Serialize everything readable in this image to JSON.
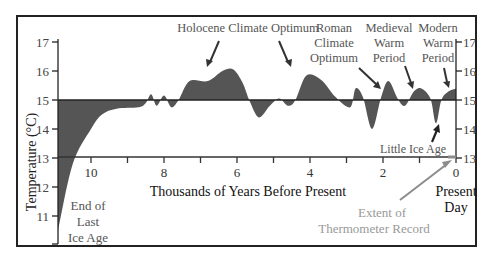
{
  "chart_data": {
    "type": "area",
    "title": "",
    "xlabel": "Thousands of Years Before Present",
    "ylabel": "Temperature (°C)",
    "xlim": [
      11,
      0
    ],
    "ylim": [
      10,
      17
    ],
    "baseline": 15,
    "x_ticks": [
      10,
      9,
      8,
      7,
      6,
      5,
      4,
      3,
      2,
      1,
      0
    ],
    "x_tick_labels": [
      "10",
      "8",
      "6",
      "4",
      "2",
      "0"
    ],
    "x_tick_label_values": [
      10,
      8,
      6,
      4,
      2,
      0
    ],
    "y_ticks": [
      17,
      16,
      15,
      14,
      13,
      12,
      11
    ],
    "y_ticks_right": [
      17,
      16,
      15,
      14,
      13
    ],
    "grid": false,
    "legend": null,
    "series": [
      {
        "name": "Global Temperature",
        "x": [
          11.0,
          10.5,
          10.0,
          9.7,
          9.3,
          8.7,
          8.5,
          8.35,
          8.2,
          8.0,
          7.8,
          7.6,
          7.3,
          6.8,
          6.4,
          6.1,
          5.85,
          5.65,
          5.4,
          5.1,
          4.85,
          4.6,
          4.4,
          4.1,
          3.7,
          3.3,
          2.9,
          2.75,
          2.55,
          2.3,
          2.05,
          1.85,
          1.6,
          1.4,
          1.15,
          0.95,
          0.7,
          0.55,
          0.4,
          0.2,
          0.0
        ],
        "y": [
          10.5,
          12.8,
          14.0,
          14.5,
          14.7,
          14.75,
          14.9,
          15.2,
          14.8,
          15.15,
          14.75,
          15.0,
          15.65,
          15.65,
          16.0,
          16.05,
          15.6,
          14.95,
          14.4,
          14.8,
          15.05,
          14.8,
          15.0,
          15.85,
          15.7,
          15.1,
          14.75,
          15.4,
          15.1,
          14.0,
          15.1,
          15.65,
          15.05,
          14.8,
          15.3,
          15.4,
          15.05,
          14.2,
          15.0,
          15.3,
          15.4
        ]
      }
    ],
    "annotations": [
      {
        "id": "holocene",
        "lines": [
          "Holocene Climate Optimum"
        ],
        "points_to_kya": [
          6.7,
          4.6
        ]
      },
      {
        "id": "roman",
        "lines": [
          "Roman",
          "Climate",
          "Optimum"
        ],
        "points_to_kya": [
          1.9
        ]
      },
      {
        "id": "medieval",
        "lines": [
          "Medieval",
          "Warm",
          "Period"
        ],
        "points_to_kya": [
          1.3
        ]
      },
      {
        "id": "modern",
        "lines": [
          "Modern",
          "Warm",
          "Period"
        ],
        "points_to_kya": [
          0.1
        ]
      },
      {
        "id": "little-ice-age",
        "lines": [
          "Little Ice Age"
        ],
        "points_to_kya": [
          0.5
        ]
      },
      {
        "id": "ice-age",
        "lines": [
          "End of",
          "Last",
          "Ice Age"
        ]
      },
      {
        "id": "thermometer",
        "lines": [
          "Extent of",
          "Thermometer Record"
        ],
        "points_to_kya": [
          0.1
        ]
      },
      {
        "id": "present",
        "lines": [
          "Present",
          "Day"
        ]
      }
    ],
    "colors": {
      "fill": "#555555",
      "axis": "#222222",
      "annotation_text": "#555555",
      "thermometer_text": "#999999",
      "thermometer_arrow": "#8c8c8c"
    }
  },
  "labels": {
    "ylabel": "Temperature (°C)",
    "xlabel": "Thousands of Years Before Present",
    "holocene": "Holocene Climate Optimum",
    "roman": [
      "Roman",
      "Climate",
      "Optimum"
    ],
    "medieval": [
      "Medieval",
      "Warm",
      "Period"
    ],
    "modern": [
      "Modern",
      "Warm",
      "Period"
    ],
    "little_ice_age": "Little Ice Age",
    "ice_age": [
      "End of",
      "Last",
      "Ice Age"
    ],
    "thermometer": [
      "Extent of",
      "Thermometer Record"
    ],
    "present": [
      "Present",
      "Day"
    ]
  }
}
